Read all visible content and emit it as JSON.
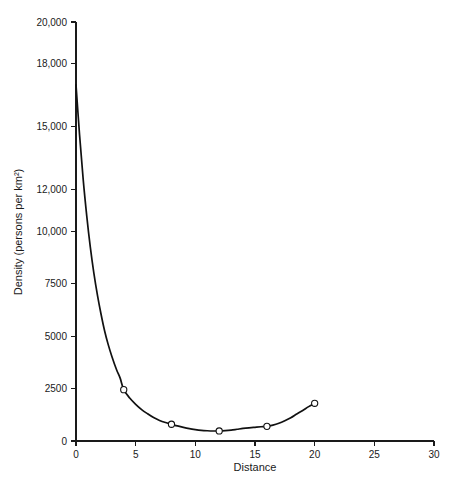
{
  "chart_data": {
    "type": "line",
    "title": "",
    "xlabel": "Distance",
    "ylabel": "Density (persons per km²)",
    "xlim": [
      0,
      30
    ],
    "ylim": [
      0,
      20000
    ],
    "grid": false,
    "legend": "none",
    "x_ticks": [
      0,
      5,
      10,
      15,
      20,
      25,
      30
    ],
    "x_tick_labels": [
      "0",
      "5",
      "10",
      "15",
      "20",
      "25",
      "30"
    ],
    "y_ticks": [
      0,
      2500,
      5000,
      7500,
      10000,
      12000,
      15000,
      18000,
      20000
    ],
    "y_tick_labels": [
      "0",
      "2500",
      "5000",
      "7500",
      "10,000",
      "12,000",
      "15,000",
      "18,000",
      "20,000"
    ],
    "series": [
      {
        "name": "Density",
        "marker": "open-circle",
        "line_style": "solid",
        "color": "#111111",
        "x": [
          0,
          4,
          8,
          12,
          16,
          20
        ],
        "values": [
          17000,
          2450,
          800,
          480,
          700,
          1800
        ],
        "marker_x": [
          4,
          8,
          12,
          16,
          20
        ],
        "marker_values": [
          2450,
          800,
          480,
          700,
          1800
        ]
      }
    ],
    "curve_points": [
      [
        0.0,
        17000
      ],
      [
        0.3,
        14600
      ],
      [
        0.6,
        12500
      ],
      [
        0.9,
        10750
      ],
      [
        1.2,
        9250
      ],
      [
        1.5,
        8000
      ],
      [
        1.8,
        6950
      ],
      [
        2.1,
        6050
      ],
      [
        2.4,
        5250
      ],
      [
        2.7,
        4600
      ],
      [
        3.0,
        4050
      ],
      [
        3.4,
        3400
      ],
      [
        3.7,
        3000
      ],
      [
        4.0,
        2450
      ],
      [
        4.5,
        2050
      ],
      [
        5.0,
        1750
      ],
      [
        5.5,
        1500
      ],
      [
        6.0,
        1300
      ],
      [
        6.5,
        1120
      ],
      [
        7.0,
        980
      ],
      [
        7.5,
        880
      ],
      [
        8.0,
        800
      ],
      [
        8.5,
        720
      ],
      [
        9.0,
        650
      ],
      [
        9.5,
        590
      ],
      [
        10.0,
        545
      ],
      [
        10.5,
        510
      ],
      [
        11.0,
        490
      ],
      [
        11.5,
        478
      ],
      [
        12.0,
        480
      ],
      [
        12.5,
        495
      ],
      [
        13.0,
        520
      ],
      [
        13.5,
        560
      ],
      [
        14.0,
        600
      ],
      [
        14.5,
        630
      ],
      [
        15.0,
        655
      ],
      [
        15.5,
        680
      ],
      [
        16.0,
        700
      ],
      [
        16.5,
        760
      ],
      [
        17.0,
        850
      ],
      [
        17.5,
        970
      ],
      [
        18.0,
        1110
      ],
      [
        18.5,
        1290
      ],
      [
        19.0,
        1460
      ],
      [
        19.5,
        1640
      ],
      [
        20.0,
        1800
      ]
    ]
  },
  "axes": {
    "x_axis_name": "Distance",
    "y_axis_name": "Density (persons per km²)"
  }
}
